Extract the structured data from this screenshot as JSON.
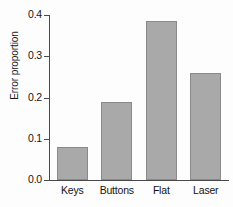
{
  "chart_data": {
    "type": "bar",
    "title": "",
    "xlabel": "",
    "ylabel": "Error proportion",
    "categories": [
      "Keys",
      "Buttons",
      "Flat",
      "Laser"
    ],
    "values": [
      0.08,
      0.19,
      0.385,
      0.26
    ],
    "ylim": [
      0.0,
      0.4
    ],
    "ytick_values": [
      0.0,
      0.1,
      0.2,
      0.3,
      0.4
    ],
    "ytick_labels": [
      "0.0",
      "0.1",
      "0.2",
      "0.3",
      "0.4"
    ],
    "grid": false,
    "legend": null,
    "bar_color": "#a9a9a9",
    "bar_edge_color": "#8a8a8a",
    "axis_color": "#4a4a4a",
    "spines": [
      "left",
      "bottom"
    ]
  }
}
